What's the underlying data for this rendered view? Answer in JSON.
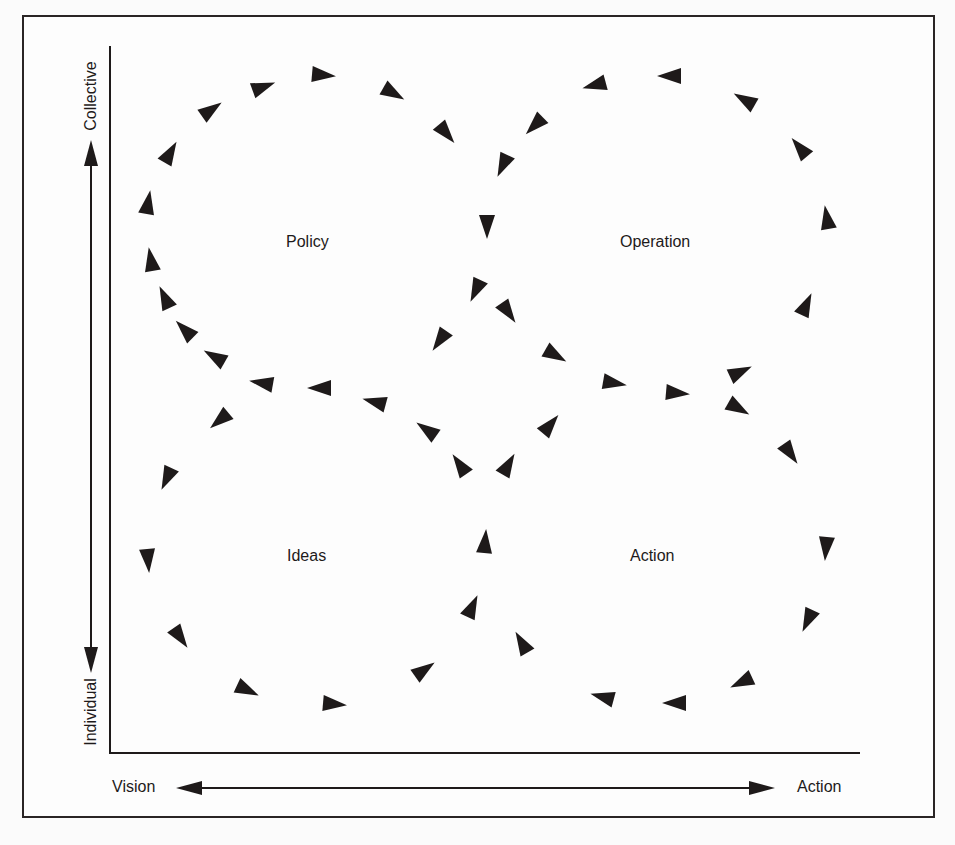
{
  "axes": {
    "y_top_label": "Collective",
    "y_bottom_label": "Individual",
    "x_left_label": "Vision",
    "x_right_label": "Action"
  },
  "quadrants": [
    {
      "id": "policy",
      "label": "Policy",
      "x": 310,
      "y": 242,
      "direction": "clockwise"
    },
    {
      "id": "operation",
      "label": "Operation",
      "x": 661,
      "y": 242,
      "direction": "counterclockwise"
    },
    {
      "id": "ideas",
      "label": "Ideas",
      "x": 310,
      "y": 556,
      "direction": "counterclockwise"
    },
    {
      "id": "action",
      "label": "Action",
      "x": 655,
      "y": 556,
      "direction": "clockwise"
    }
  ],
  "colors": {
    "ink": "#1e1a1a",
    "background": "#fdfdfd"
  },
  "flow_arrows": [
    {
      "loop": "policy",
      "x": 263,
      "y": 87,
      "angle": -20
    },
    {
      "loop": "policy",
      "x": 323,
      "y": 75,
      "angle": 5
    },
    {
      "loop": "policy",
      "x": 393,
      "y": 93,
      "angle": 30
    },
    {
      "loop": "policy",
      "x": 446,
      "y": 133,
      "angle": 50
    },
    {
      "loop": "policy",
      "x": 211,
      "y": 110,
      "angle": -35
    },
    {
      "loop": "policy",
      "x": 170,
      "y": 153,
      "angle": -60
    },
    {
      "loop": "policy",
      "x": 148,
      "y": 203,
      "angle": -80
    },
    {
      "loop": "policy",
      "x": 151,
      "y": 260,
      "angle": -100
    },
    {
      "loop": "policy",
      "x": 165,
      "y": 298,
      "angle": -115
    },
    {
      "loop": "policy",
      "x": 185,
      "y": 330,
      "angle": -135
    },
    {
      "loop": "policy",
      "x": 215,
      "y": 357,
      "angle": -150
    },
    {
      "loop": "policy",
      "x": 262,
      "y": 383,
      "angle": -170
    },
    {
      "loop": "policy",
      "x": 320,
      "y": 388,
      "angle": 180
    },
    {
      "loop": "policy",
      "x": 375,
      "y": 402,
      "angle": -165
    },
    {
      "loop": "policy",
      "x": 487,
      "y": 226,
      "angle": 90
    },
    {
      "loop": "policy",
      "x": 476,
      "y": 290,
      "angle": 115
    },
    {
      "loop": "policy",
      "x": 440,
      "y": 340,
      "angle": 125
    },
    {
      "loop": "operation",
      "x": 535,
      "y": 125,
      "angle": 135
    },
    {
      "loop": "operation",
      "x": 503,
      "y": 165,
      "angle": 115
    },
    {
      "loop": "operation",
      "x": 595,
      "y": 85,
      "angle": 165
    },
    {
      "loop": "operation",
      "x": 670,
      "y": 76,
      "angle": 180
    },
    {
      "loop": "operation",
      "x": 745,
      "y": 100,
      "angle": -150
    },
    {
      "loop": "operation",
      "x": 800,
      "y": 148,
      "angle": -130
    },
    {
      "loop": "operation",
      "x": 827,
      "y": 218,
      "angle": -100
    },
    {
      "loop": "operation",
      "x": 806,
      "y": 305,
      "angle": -65
    },
    {
      "loop": "operation",
      "x": 740,
      "y": 372,
      "angle": -25
    },
    {
      "loop": "operation",
      "x": 677,
      "y": 393,
      "angle": 5
    },
    {
      "loop": "operation",
      "x": 614,
      "y": 383,
      "angle": 10
    },
    {
      "loop": "operation",
      "x": 555,
      "y": 355,
      "angle": 30
    },
    {
      "loop": "operation",
      "x": 508,
      "y": 312,
      "angle": 55
    },
    {
      "loop": "action",
      "x": 738,
      "y": 408,
      "angle": 30
    },
    {
      "loop": "action",
      "x": 790,
      "y": 453,
      "angle": 55
    },
    {
      "loop": "action",
      "x": 826,
      "y": 548,
      "angle": 95
    },
    {
      "loop": "action",
      "x": 808,
      "y": 620,
      "angle": 115
    },
    {
      "loop": "action",
      "x": 742,
      "y": 682,
      "angle": 155
    },
    {
      "loop": "action",
      "x": 675,
      "y": 703,
      "angle": 180
    },
    {
      "loop": "action",
      "x": 603,
      "y": 697,
      "angle": -165
    },
    {
      "loop": "action",
      "x": 522,
      "y": 643,
      "angle": -120
    },
    {
      "loop": "action",
      "x": 508,
      "y": 465,
      "angle": -60
    },
    {
      "loop": "action",
      "x": 550,
      "y": 425,
      "angle": -50
    },
    {
      "loop": "ideas",
      "x": 220,
      "y": 420,
      "angle": 140
    },
    {
      "loop": "ideas",
      "x": 167,
      "y": 478,
      "angle": 115
    },
    {
      "loop": "ideas",
      "x": 148,
      "y": 560,
      "angle": 85
    },
    {
      "loop": "ideas",
      "x": 180,
      "y": 637,
      "angle": 55
    },
    {
      "loop": "ideas",
      "x": 247,
      "y": 690,
      "angle": 25
    },
    {
      "loop": "ideas",
      "x": 334,
      "y": 704,
      "angle": 5
    },
    {
      "loop": "ideas",
      "x": 424,
      "y": 670,
      "angle": -35
    },
    {
      "loop": "ideas",
      "x": 472,
      "y": 607,
      "angle": -65
    },
    {
      "loop": "ideas",
      "x": 485,
      "y": 542,
      "angle": -85
    },
    {
      "loop": "ideas",
      "x": 460,
      "y": 465,
      "angle": -125
    },
    {
      "loop": "ideas",
      "x": 427,
      "y": 430,
      "angle": -145
    }
  ]
}
